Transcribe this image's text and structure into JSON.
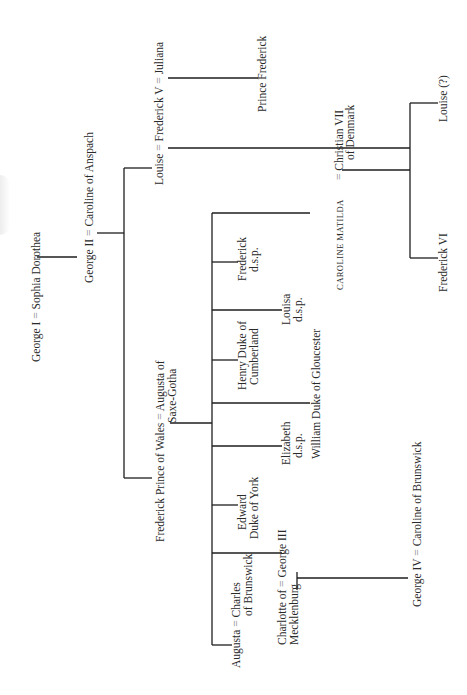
{
  "diagram": {
    "orientation": "rotated-90-ccw",
    "marriage_symbol": "=",
    "nodes": {
      "george_i": "George I",
      "sophia_dorothea": "Sophia Dorothea",
      "george_ii": "George II",
      "caroline_anspach": "Caroline of Anspach",
      "louise": "Louise",
      "frederick_v": "Frederick V",
      "juliana": "Juliana",
      "prince_frederick": "Prince Frederick",
      "frederick_prince_wales": "Frederick Prince of Wales",
      "augusta_saxe_1": "Augusta of",
      "augusta_saxe_2": "Saxe-Gotha",
      "augusta": "Augusta",
      "charles_1": "Charles",
      "charles_2": "of Brunswick",
      "charlotte_1": "Charlotte of",
      "charlotte_2": "Mecklenburg",
      "george_iii": "George III",
      "edward_1": "Edward",
      "edward_2": "Duke of York",
      "elizabeth_1": "Elizabeth",
      "elizabeth_2": "d.s.p.",
      "william": "William Duke of Gloucester",
      "henry_1": "Henry Duke of",
      "henry_2": "Cumberland",
      "louisa_1": "Louisa",
      "louisa_2": "d.s.p.",
      "frederick_1": "Frederick",
      "frederick_2": "d.s.p.",
      "caroline_matilda": "CAROLINE MATILDA",
      "christian_1": "Christian VII",
      "christian_2": "of Denmark",
      "frederick_vi": "Frederick VI",
      "louise_q": "Louise (?)",
      "george_iv": "George IV",
      "caroline_brunswick": "Caroline of Brunswick"
    }
  }
}
